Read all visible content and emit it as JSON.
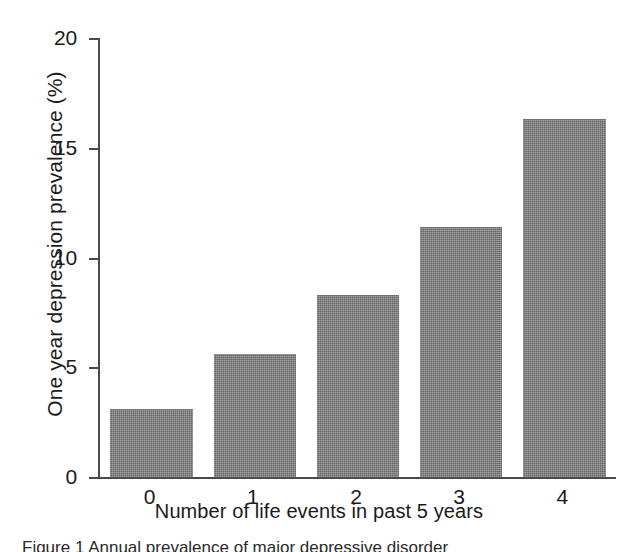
{
  "chart_data": {
    "type": "bar",
    "title": "",
    "subtitle": "",
    "xlabel": "Number of life events in past 5 years",
    "ylabel": "One year depression prevalence (%)",
    "categories": [
      "0",
      "1",
      "2",
      "3",
      "4"
    ],
    "values": [
      3.1,
      5.6,
      8.3,
      11.4,
      16.3
    ],
    "series": [
      {
        "name": "One year depression prevalence",
        "values": [
          3.1,
          5.6,
          8.3,
          11.4,
          16.3
        ]
      }
    ],
    "ylim": [
      0,
      20
    ],
    "yticks": [
      0,
      5,
      10,
      15,
      20
    ],
    "yticklabels": [
      "0",
      "5",
      "10",
      "15",
      "20"
    ],
    "xticklabels": [
      "0",
      "1",
      "2",
      "3",
      "4"
    ],
    "grid": false,
    "legend": false,
    "legend_position": "none",
    "bar_color": "#7c7c7c",
    "axis_color": "#4a4a4a",
    "text_color": "#1a1a1a",
    "background": "#ffffff",
    "annotations": []
  },
  "caption": {
    "text": "Figure 1 Annual prevalence of major depressive disorder"
  }
}
